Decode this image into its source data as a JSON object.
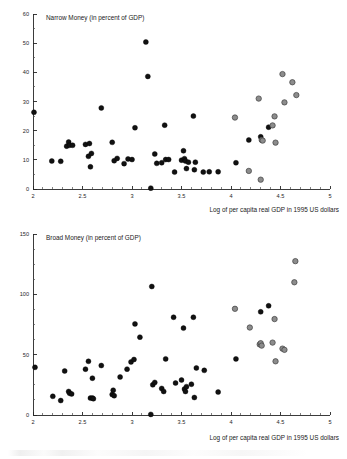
{
  "figure": {
    "background_color": "#ffffff",
    "marker_colors": {
      "developing_economies": "#111111",
      "advanced_economies": "#8c8c8c"
    }
  },
  "chart_data": [
    {
      "type": "scatter",
      "id": "narrow-money",
      "title": "Narrow Money (in percent of GDP)",
      "xlabel": "Log of per capita real GDP in 1995 US dollars",
      "ylabel": "",
      "xlim": [
        2,
        5
      ],
      "ylim": [
        0,
        60
      ],
      "xticks": [
        2,
        2.5,
        3,
        3.5,
        4,
        4.5,
        5
      ],
      "xticklabels": [
        "2",
        "2.5",
        "3",
        "3.5",
        "4",
        "4.5",
        "5"
      ],
      "yticks": [
        0,
        10,
        20,
        30,
        40,
        50,
        60
      ],
      "yticklabels": [
        "0",
        "10",
        "20",
        "30",
        "40",
        "50",
        "60"
      ],
      "x_minor_tick_step": 0.1,
      "y_minor_tick_step": 5,
      "grid": false,
      "legend": "none",
      "series": [
        {
          "name": "dark-markers",
          "color": "#111111",
          "points": [
            [
              2.01,
              26.3
            ],
            [
              2.19,
              9.6
            ],
            [
              2.28,
              9.5
            ],
            [
              2.34,
              14.7
            ],
            [
              2.36,
              16.1
            ],
            [
              2.37,
              15.0
            ],
            [
              2.4,
              15.0
            ],
            [
              2.53,
              15.3
            ],
            [
              2.57,
              15.6
            ],
            [
              2.56,
              11.2
            ],
            [
              2.59,
              12.2
            ],
            [
              2.58,
              7.6
            ],
            [
              2.69,
              27.8
            ],
            [
              2.8,
              16.0
            ],
            [
              2.82,
              9.7
            ],
            [
              2.85,
              10.5
            ],
            [
              2.92,
              8.7
            ],
            [
              2.96,
              10.3
            ],
            [
              3.0,
              10.1
            ],
            [
              3.03,
              21.0
            ],
            [
              3.14,
              50.4
            ],
            [
              3.16,
              38.6
            ],
            [
              3.19,
              0.3
            ],
            [
              3.23,
              12.0
            ],
            [
              3.25,
              8.8
            ],
            [
              3.3,
              9.0
            ],
            [
              3.33,
              21.9
            ],
            [
              3.34,
              10.1
            ],
            [
              3.37,
              10.1
            ],
            [
              3.43,
              5.8
            ],
            [
              3.5,
              9.9
            ],
            [
              3.52,
              13.1
            ],
            [
              3.53,
              10.4
            ],
            [
              3.54,
              9.6
            ],
            [
              3.55,
              7.0
            ],
            [
              3.57,
              9.2
            ],
            [
              3.62,
              25.0
            ],
            [
              3.63,
              6.6
            ],
            [
              3.64,
              9.2
            ],
            [
              3.72,
              5.8
            ],
            [
              3.78,
              5.9
            ],
            [
              3.87,
              5.9
            ],
            [
              4.05,
              9.0
            ],
            [
              4.18,
              16.8
            ],
            [
              4.3,
              17.9
            ],
            [
              4.38,
              21.2
            ]
          ]
        },
        {
          "name": "gray-markers",
          "color": "#8c8c8c",
          "points": [
            [
              4.04,
              24.5
            ],
            [
              4.18,
              6.2
            ],
            [
              4.28,
              31.0
            ],
            [
              4.3,
              3.2
            ],
            [
              4.31,
              16.8
            ],
            [
              4.32,
              16.6
            ],
            [
              4.42,
              21.8
            ],
            [
              4.44,
              24.9
            ],
            [
              4.45,
              15.9
            ],
            [
              4.52,
              39.4
            ],
            [
              4.54,
              29.7
            ],
            [
              4.62,
              36.6
            ],
            [
              4.66,
              32.2
            ]
          ]
        }
      ]
    },
    {
      "type": "scatter",
      "id": "broad-money",
      "title": "Broad Money (in percent of GDP)",
      "xlabel": "Log of per capita real GDP in 1995 US dollars",
      "ylabel": "",
      "xlim": [
        2,
        5
      ],
      "ylim": [
        0,
        150
      ],
      "xticks": [
        2,
        2.5,
        3,
        3.5,
        4,
        4.5,
        5
      ],
      "xticklabels": [
        "2",
        "2.5",
        "3",
        "3.5",
        "4",
        "4.5",
        "5"
      ],
      "yticks": [
        0,
        50,
        100,
        150
      ],
      "yticklabels": [
        "0",
        "50",
        "100",
        "150"
      ],
      "x_minor_tick_step": 0.1,
      "y_minor_tick_step": 12.5,
      "grid": false,
      "legend": "none",
      "series": [
        {
          "name": "dark-markers",
          "color": "#111111",
          "points": [
            [
              2.02,
              39.5
            ],
            [
              2.2,
              15.5
            ],
            [
              2.28,
              12.0
            ],
            [
              2.32,
              36.5
            ],
            [
              2.36,
              19.5
            ],
            [
              2.37,
              18.0
            ],
            [
              2.39,
              17.5
            ],
            [
              2.53,
              38.0
            ],
            [
              2.56,
              44.5
            ],
            [
              2.58,
              14.0
            ],
            [
              2.6,
              14.0
            ],
            [
              2.61,
              13.5
            ],
            [
              2.6,
              30.5
            ],
            [
              2.69,
              41.0
            ],
            [
              2.8,
              17.0
            ],
            [
              2.81,
              20.5
            ],
            [
              2.82,
              16.0
            ],
            [
              2.88,
              31.5
            ],
            [
              2.95,
              38.0
            ],
            [
              2.99,
              44.0
            ],
            [
              3.02,
              46.0
            ],
            [
              3.03,
              75.5
            ],
            [
              3.08,
              64.5
            ],
            [
              3.19,
              0.5
            ],
            [
              3.2,
              106.5
            ],
            [
              3.21,
              25.0
            ],
            [
              3.23,
              27.0
            ],
            [
              3.3,
              22.0
            ],
            [
              3.32,
              19.5
            ],
            [
              3.34,
              46.5
            ],
            [
              3.42,
              81.0
            ],
            [
              3.44,
              26.5
            ],
            [
              3.5,
              29.0
            ],
            [
              3.52,
              72.0
            ],
            [
              3.53,
              21.5
            ],
            [
              3.54,
              19.5
            ],
            [
              3.55,
              23.5
            ],
            [
              3.6,
              25.5
            ],
            [
              3.62,
              81.0
            ],
            [
              3.63,
              14.5
            ],
            [
              3.65,
              39.0
            ],
            [
              3.73,
              37.0
            ],
            [
              3.87,
              19.0
            ],
            [
              4.05,
              46.5
            ],
            [
              4.3,
              85.5
            ],
            [
              4.38,
              90.5
            ]
          ]
        },
        {
          "name": "gray-markers",
          "color": "#8c8c8c",
          "points": [
            [
              4.04,
              88.0
            ],
            [
              4.19,
              72.5
            ],
            [
              4.29,
              58.5
            ],
            [
              4.3,
              59.5
            ],
            [
              4.31,
              57.5
            ],
            [
              4.42,
              60.0
            ],
            [
              4.44,
              79.5
            ],
            [
              4.45,
              44.5
            ],
            [
              4.52,
              55.0
            ],
            [
              4.54,
              54.0
            ],
            [
              4.64,
              110.0
            ],
            [
              4.65,
              127.5
            ]
          ]
        }
      ]
    }
  ]
}
